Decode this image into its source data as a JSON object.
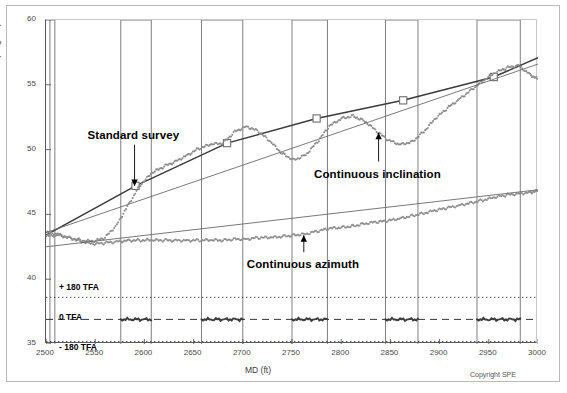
{
  "figure": {
    "copyright": "Copyright SPE"
  },
  "chart_data": {
    "type": "line",
    "title": "",
    "xlabel": "MD (ft)",
    "ylabel": "INCLINATION (degree)",
    "xlim": [
      2500,
      3000
    ],
    "ylim": [
      35,
      60
    ],
    "xticks": [
      2500,
      2550,
      2600,
      2650,
      2700,
      2750,
      2800,
      2850,
      2900,
      2950,
      3000
    ],
    "yticks": [
      35,
      40,
      45,
      50,
      55,
      60
    ],
    "grid": false,
    "legend_position": "none",
    "annotations": [
      {
        "name": "standard-survey",
        "text": "Standard survey",
        "x": 2590,
        "y": 51.0,
        "arrow": "down",
        "arrow_to_y": 47.2
      },
      {
        "name": "continuous-inclination",
        "text": "Continuous inclination",
        "x": 2838,
        "y": 48.0,
        "arrow": "up",
        "arrow_to_y": 51.3
      },
      {
        "name": "continuous-azimuth",
        "text": "Continuous azimuth",
        "x": 2762,
        "y": 41.0,
        "arrow": "up",
        "arrow_to_y": 43.4
      }
    ],
    "reference_lines": [
      {
        "name": "plus-180-tfa",
        "label": "+ 180 TFA",
        "y": 38.6,
        "style": "dotted"
      },
      {
        "name": "zero-tfa",
        "label": "0 TFA",
        "y": 36.9,
        "style": "dashed"
      },
      {
        "name": "minus-180-tfa",
        "label": "- 180 TFA",
        "y": 35.2,
        "style": "dotted"
      }
    ],
    "survey_bands": [
      {
        "name": "band-1",
        "x0": 2504,
        "x1": 2509
      },
      {
        "name": "band-2",
        "x0": 2576,
        "x1": 2607
      },
      {
        "name": "band-3",
        "x0": 2658,
        "x1": 2700
      },
      {
        "name": "band-4",
        "x0": 2750,
        "x1": 2786
      },
      {
        "name": "band-5",
        "x0": 2845,
        "x1": 2878
      },
      {
        "name": "band-6",
        "x0": 2938,
        "x1": 2982
      }
    ],
    "series": [
      {
        "name": "Standard survey",
        "style": "line-with-square-markers",
        "color": "#3b3b3b",
        "x": [
          2500,
          2591,
          2684,
          2775,
          2863,
          2955,
          3000
        ],
        "values": [
          43.4,
          47.2,
          50.5,
          52.4,
          53.8,
          55.6,
          57.1
        ]
      },
      {
        "name": "Continuous inclination",
        "style": "dotted-scatter",
        "color": "#8c8c8c",
        "x": [
          2500,
          2512,
          2524,
          2536,
          2548,
          2560,
          2572,
          2584,
          2596,
          2608,
          2620,
          2632,
          2644,
          2656,
          2668,
          2680,
          2692,
          2704,
          2716,
          2728,
          2740,
          2752,
          2764,
          2776,
          2788,
          2800,
          2812,
          2824,
          2836,
          2848,
          2860,
          2872,
          2884,
          2896,
          2908,
          2920,
          2932,
          2944,
          2956,
          2968,
          2980,
          2992,
          3000
        ],
        "values": [
          43.6,
          43.5,
          43.2,
          43.0,
          42.9,
          43.2,
          44.2,
          45.8,
          47.3,
          48.2,
          48.7,
          49.1,
          49.6,
          50.1,
          50.4,
          50.5,
          51.4,
          51.8,
          51.4,
          50.6,
          49.7,
          49.2,
          49.6,
          50.6,
          51.8,
          52.4,
          52.6,
          52.2,
          51.4,
          50.7,
          50.4,
          50.6,
          51.4,
          52.4,
          53.2,
          53.9,
          54.6,
          55.3,
          55.9,
          56.3,
          56.5,
          55.8,
          55.4
        ]
      },
      {
        "name": "Continuous azimuth",
        "style": "dotted-scatter",
        "color": "#8f8f8f",
        "x": [
          2500,
          2512,
          2524,
          2536,
          2548,
          2560,
          2572,
          2584,
          2596,
          2608,
          2620,
          2632,
          2644,
          2656,
          2668,
          2680,
          2692,
          2704,
          2716,
          2728,
          2740,
          2752,
          2764,
          2776,
          2788,
          2800,
          2812,
          2824,
          2836,
          2848,
          2860,
          2872,
          2884,
          2896,
          2908,
          2920,
          2932,
          2944,
          2956,
          2968,
          2980,
          2992,
          3000
        ],
        "values": [
          43.3,
          43.4,
          43.2,
          42.9,
          42.7,
          42.8,
          42.9,
          43.0,
          43.0,
          43.0,
          43.0,
          43.0,
          43.0,
          43.0,
          43.0,
          43.0,
          43.1,
          43.1,
          43.2,
          43.2,
          43.3,
          43.4,
          43.5,
          43.7,
          43.9,
          44.0,
          44.1,
          44.3,
          44.4,
          44.5,
          44.7,
          44.9,
          45.1,
          45.3,
          45.5,
          45.7,
          45.9,
          46.1,
          46.3,
          46.5,
          46.6,
          46.7,
          46.8
        ]
      },
      {
        "name": "Azimuth trend",
        "style": "solid-thin-line",
        "color": "#6a6a6a",
        "x": [
          2500,
          3000
        ],
        "values": [
          42.5,
          46.9
        ]
      },
      {
        "name": "Inclination trend",
        "style": "solid-thin-line",
        "color": "#6a6a6a",
        "x": [
          2500,
          3000
        ],
        "values": [
          43.6,
          56.6
        ]
      }
    ],
    "tfa_traces": [
      {
        "name": "tfa-segment-1",
        "x0": 2576,
        "x1": 2607,
        "y": 36.9
      },
      {
        "name": "tfa-segment-2",
        "x0": 2658,
        "x1": 2700,
        "y": 36.9
      },
      {
        "name": "tfa-segment-3",
        "x0": 2750,
        "x1": 2786,
        "y": 36.9
      },
      {
        "name": "tfa-segment-4",
        "x0": 2845,
        "x1": 2878,
        "y": 36.9
      },
      {
        "name": "tfa-segment-5",
        "x0": 2938,
        "x1": 2982,
        "y": 36.9
      }
    ]
  }
}
